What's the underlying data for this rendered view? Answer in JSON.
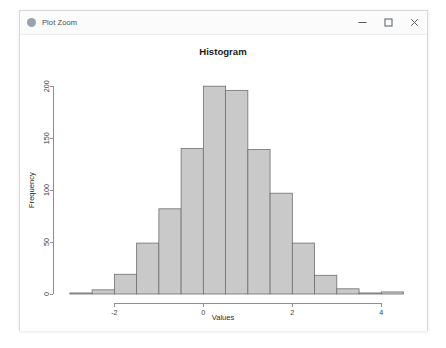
{
  "window": {
    "title": "Plot Zoom",
    "icon": "circle-icon",
    "controls": {
      "minimize": "minimize-icon",
      "maximize": "maximize-icon",
      "close": "close-icon"
    }
  },
  "chart_data": {
    "type": "bar",
    "title": "Histogram",
    "xlabel": "Values",
    "ylabel": "Frequency",
    "xlim": [
      -3.2,
      4.6
    ],
    "ylim": [
      0,
      205
    ],
    "xticks": [
      -2,
      0,
      2,
      4
    ],
    "xtick_labels": [
      "-2",
      "0",
      "2",
      "4"
    ],
    "yticks": [
      0,
      50,
      100,
      150,
      200
    ],
    "ytick_labels": [
      "0",
      "50",
      "100",
      "150",
      "200"
    ],
    "grid": false,
    "legend": "none",
    "bin_width": 0.5,
    "bin_edges": [
      -3.0,
      -2.5,
      -2.0,
      -1.5,
      -1.0,
      -0.5,
      0.0,
      0.5,
      1.0,
      1.5,
      2.0,
      2.5,
      3.0,
      3.5,
      4.0,
      4.5
    ],
    "categories": [
      "-3.0",
      "-2.5",
      "-2.0",
      "-1.5",
      "-1.0",
      "-0.5",
      "0.0",
      "0.5",
      "1.0",
      "1.5",
      "2.0",
      "2.5",
      "3.0",
      "3.5",
      "4.0"
    ],
    "values": [
      1,
      4,
      19,
      49,
      82,
      140,
      200,
      196,
      139,
      97,
      49,
      18,
      5,
      1,
      2
    ],
    "bar_fill": "#c9c9c9",
    "bar_stroke": "#6f6f6f"
  }
}
